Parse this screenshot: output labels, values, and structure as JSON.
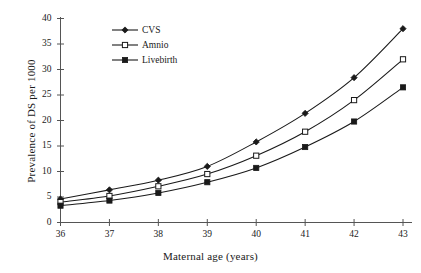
{
  "chart_data": {
    "type": "line",
    "title": "",
    "xlabel": "Maternal age (years)",
    "ylabel": "Prevalence of DS per 1000",
    "x": [
      36,
      37,
      38,
      39,
      40,
      41,
      42,
      43
    ],
    "xlim": [
      36,
      43
    ],
    "ylim": [
      0,
      40
    ],
    "xticks": [
      "36",
      "37",
      "38",
      "39",
      "40",
      "41",
      "42",
      "43"
    ],
    "yticks": [
      "0",
      "5",
      "10",
      "15",
      "20",
      "25",
      "30",
      "35",
      "40"
    ],
    "grid": false,
    "legend_position": "upper left",
    "series": [
      {
        "name": "CVS",
        "marker": "filled-diamond",
        "color": "#1a1a1a",
        "values": [
          4.6,
          6.4,
          8.3,
          11.0,
          15.8,
          21.4,
          28.4,
          38.0
        ]
      },
      {
        "name": "Amnio",
        "marker": "open-square",
        "color": "#1a1a1a",
        "values": [
          4.0,
          5.2,
          7.1,
          9.5,
          13.1,
          17.8,
          24.0,
          32.0
        ]
      },
      {
        "name": "Livebirth",
        "marker": "filled-square",
        "color": "#1a1a1a",
        "values": [
          3.3,
          4.3,
          5.8,
          7.9,
          10.7,
          14.8,
          19.8,
          26.5
        ]
      }
    ]
  },
  "legend": {
    "items": [
      {
        "label": "CVS",
        "marker": "filled-diamond"
      },
      {
        "label": "Amnio",
        "marker": "open-square"
      },
      {
        "label": "Livebirth",
        "marker": "filled-square"
      }
    ]
  },
  "axes": {
    "x_title": "Maternal age (years)",
    "y_title": "Prevalence of  DS per 1000"
  }
}
